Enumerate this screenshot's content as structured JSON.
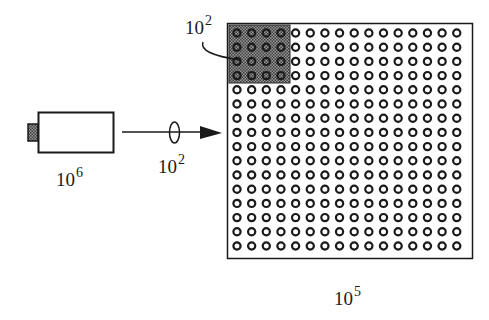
{
  "diagram": {
    "camera": {
      "label_base": "10",
      "label_exp": "6",
      "icon": "camera-icon"
    },
    "beam": {
      "label_base": "10",
      "label_exp": "2",
      "icon": "lens-icon"
    },
    "sensor_array": {
      "rows": 16,
      "cols": 16,
      "highlight_rows": 4,
      "highlight_cols": 4,
      "label_base": "10",
      "label_exp": "5"
    },
    "highlight_block": {
      "label_base": "10",
      "label_exp": "2"
    },
    "colors": {
      "stroke": "#1a1a1a",
      "highlight_fill": "#6e6e6e",
      "background": "#ffffff"
    }
  }
}
